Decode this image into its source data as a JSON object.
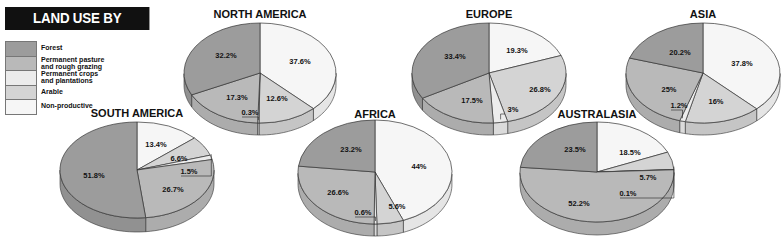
{
  "title": "LAND USE BY CONTINENT",
  "legend": [
    {
      "key": "forest",
      "label": "Forest",
      "color": "#9c9c9c"
    },
    {
      "key": "pasture",
      "label": "Permanent pasture and rough grazing",
      "line1": "Permanent pasture",
      "line2": "and rough grazing",
      "color": "#b9b9b9"
    },
    {
      "key": "crops",
      "label": "Permanent crops and plantations",
      "line1": "Permanent crops",
      "line2": "and plantations",
      "color": "#ececec"
    },
    {
      "key": "arable",
      "label": "Arable",
      "color": "#d4d4d4"
    },
    {
      "key": "nonprod",
      "label": "Non-productive",
      "color": "#f6f6f6"
    }
  ],
  "chart_data": {
    "type": "pie",
    "title": "LAND USE BY CONTINENT",
    "legend_position": "top-left",
    "categories": [
      "Forest",
      "Permanent pasture and rough grazing",
      "Permanent crops and plantations",
      "Arable",
      "Non-productive"
    ],
    "pies": [
      {
        "name": "NORTH AMERICA",
        "values": {
          "Forest": 32.2,
          "Permanent pasture and rough grazing": 17.3,
          "Permanent crops and plantations": 0.3,
          "Arable": 12.6,
          "Non-productive": 37.6
        }
      },
      {
        "name": "EUROPE",
        "values": {
          "Forest": 33.4,
          "Permanent pasture and rough grazing": 17.5,
          "Permanent crops and plantations": 3,
          "Arable": 26.8,
          "Non-productive": 19.3
        }
      },
      {
        "name": "ASIA",
        "values": {
          "Forest": 20.2,
          "Permanent pasture and rough grazing": 25,
          "Permanent crops and plantations": 1.2,
          "Arable": 16,
          "Non-productive": 37.8
        }
      },
      {
        "name": "SOUTH AMERICA",
        "values": {
          "Forest": 51.8,
          "Permanent pasture and rough grazing": 26.7,
          "Permanent crops and plantations": 1.5,
          "Arable": 6.6,
          "Non-productive": 13.4
        }
      },
      {
        "name": "AFRICA",
        "values": {
          "Forest": 23.2,
          "Permanent pasture and rough grazing": 26.6,
          "Permanent crops and plantations": 0.6,
          "Arable": 5.6,
          "Non-productive": 44
        }
      },
      {
        "name": "AUSTRALASIA",
        "values": {
          "Forest": 23.5,
          "Permanent pasture and rough grazing": 52.2,
          "Permanent crops and plantations": 0.1,
          "Arable": 5.7,
          "Non-productive": 18.5
        }
      }
    ]
  },
  "pies": [
    {
      "name": "NORTH AMERICA",
      "cx": 260,
      "cy": 73,
      "rx": 76,
      "ry": 50,
      "depth": 12,
      "title_y": 18,
      "slices": [
        {
          "key": "nonprod",
          "value": 37.6,
          "label": "37.6%",
          "lx": 300,
          "ly": 64
        },
        {
          "key": "arable",
          "value": 12.6,
          "label": "12.6%",
          "lx": 277,
          "ly": 101
        },
        {
          "key": "crops",
          "value": 0.3,
          "label": "0.3%",
          "lx": 250,
          "ly": 115,
          "callout": true
        },
        {
          "key": "pasture",
          "value": 17.3,
          "label": "17.3%",
          "lx": 237,
          "ly": 100
        },
        {
          "key": "forest",
          "value": 32.2,
          "label": "32.2%",
          "lx": 226,
          "ly": 58
        }
      ]
    },
    {
      "name": "EUROPE",
      "cx": 489,
      "cy": 73,
      "rx": 77,
      "ry": 50,
      "depth": 12,
      "title_y": 18,
      "slices": [
        {
          "key": "nonprod",
          "value": 19.3,
          "label": "19.3%",
          "lx": 517,
          "ly": 53
        },
        {
          "key": "arable",
          "value": 26.8,
          "label": "26.8%",
          "lx": 540,
          "ly": 92
        },
        {
          "key": "crops",
          "value": 3,
          "label": "3%",
          "lx": 513,
          "ly": 112,
          "callout": true
        },
        {
          "key": "pasture",
          "value": 17.5,
          "label": "17.5%",
          "lx": 472,
          "ly": 103
        },
        {
          "key": "forest",
          "value": 33.4,
          "label": "33.4%",
          "lx": 455,
          "ly": 59
        }
      ]
    },
    {
      "name": "ASIA",
      "cx": 703,
      "cy": 73,
      "rx": 77,
      "ry": 50,
      "depth": 12,
      "title_y": 18,
      "slices": [
        {
          "key": "nonprod",
          "value": 37.8,
          "label": "37.8%",
          "lx": 742,
          "ly": 66
        },
        {
          "key": "arable",
          "value": 16,
          "label": "16%",
          "lx": 716,
          "ly": 104
        },
        {
          "key": "crops",
          "value": 1.2,
          "label": "1.2%",
          "lx": 679,
          "ly": 108,
          "callout": true
        },
        {
          "key": "pasture",
          "value": 25,
          "label": "25%",
          "lx": 669,
          "ly": 92
        },
        {
          "key": "forest",
          "value": 20.2,
          "label": "20.2%",
          "lx": 680,
          "ly": 55
        }
      ]
    },
    {
      "name": "SOUTH AMERICA",
      "cx": 137,
      "cy": 170,
      "rx": 77,
      "ry": 48,
      "depth": 14,
      "title_y": 117,
      "slices": [
        {
          "key": "nonprod",
          "value": 13.4,
          "label": "13.4%",
          "lx": 156,
          "ly": 147
        },
        {
          "key": "arable",
          "value": 6.6,
          "label": "6.6%",
          "lx": 179,
          "ly": 161
        },
        {
          "key": "crops",
          "value": 1.5,
          "label": "1.5%",
          "lx": 189,
          "ly": 174,
          "callout": true
        },
        {
          "key": "pasture",
          "value": 26.7,
          "label": "26.7%",
          "lx": 173,
          "ly": 192
        },
        {
          "key": "forest",
          "value": 51.8,
          "label": "51.8%",
          "lx": 94,
          "ly": 178
        }
      ]
    },
    {
      "name": "AFRICA",
      "cx": 375,
      "cy": 172,
      "rx": 77,
      "ry": 52,
      "depth": 12,
      "title_y": 118,
      "slices": [
        {
          "key": "nonprod",
          "value": 44,
          "label": "44%",
          "lx": 419,
          "ly": 169
        },
        {
          "key": "arable",
          "value": 5.6,
          "label": "5.6%",
          "lx": 397,
          "ly": 209
        },
        {
          "key": "crops",
          "value": 0.6,
          "label": "0.6%",
          "lx": 363,
          "ly": 215,
          "callout": true
        },
        {
          "key": "pasture",
          "value": 26.6,
          "label": "26.6%",
          "lx": 338,
          "ly": 195
        },
        {
          "key": "forest",
          "value": 23.2,
          "label": "23.2%",
          "lx": 351,
          "ly": 152
        }
      ]
    },
    {
      "name": "AUSTRALASIA",
      "cx": 597,
      "cy": 172,
      "rx": 77,
      "ry": 50,
      "depth": 13,
      "title_y": 118,
      "slices": [
        {
          "key": "nonprod",
          "value": 18.5,
          "label": "18.5%",
          "lx": 630,
          "ly": 155
        },
        {
          "key": "arable",
          "value": 5.7,
          "label": "5.7%",
          "lx": 648,
          "ly": 180
        },
        {
          "key": "crops",
          "value": 0.1,
          "label": "0.1%",
          "lx": 628,
          "ly": 196,
          "callout": true
        },
        {
          "key": "pasture",
          "value": 52.2,
          "label": "52.2%",
          "lx": 579,
          "ly": 206
        },
        {
          "key": "forest",
          "value": 23.5,
          "label": "23.5%",
          "lx": 575,
          "ly": 152
        }
      ]
    }
  ]
}
